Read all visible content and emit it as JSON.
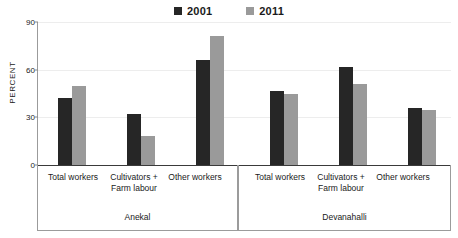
{
  "chart_data": {
    "type": "bar",
    "title": "",
    "xlabel": "",
    "ylabel": "PERCENT",
    "ylim": [
      0,
      90
    ],
    "yticks": [
      0,
      30,
      60,
      90
    ],
    "ytick_labels": [
      "0",
      "30",
      "60",
      "90"
    ],
    "grid": true,
    "legend_position": "top-center",
    "groups": [
      {
        "name": "Anekal",
        "categories": [
          "Total workers",
          "Cultivators +\nFarm labour",
          "Other workers"
        ]
      },
      {
        "name": "Devanahalli",
        "categories": [
          "Total workers",
          "Cultivators +\nFarm labour",
          "Other workers"
        ]
      }
    ],
    "categories": [
      "Total workers",
      "Cultivators + Farm labour",
      "Other workers",
      "Total workers",
      "Cultivators + Farm labour",
      "Other workers"
    ],
    "series": [
      {
        "name": "2001",
        "color": "#262626",
        "values": [
          42,
          32,
          66,
          46.5,
          62,
          36
        ]
      },
      {
        "name": "2011",
        "color": "#9a9a9a",
        "values": [
          49.5,
          18,
          81,
          44.5,
          51,
          34.5
        ]
      }
    ]
  },
  "legend": {
    "entries": [
      {
        "label": "2001",
        "color": "#262626",
        "swatch_name": "legend-swatch-2001"
      },
      {
        "label": "2011",
        "color": "#9a9a9a",
        "swatch_name": "legend-swatch-2011"
      }
    ]
  },
  "axis": {
    "y_title": "PERCENT",
    "y_ticks": [
      "90",
      "60",
      "30",
      "0"
    ]
  },
  "categories_display": [
    {
      "line1": "Total workers",
      "line2": ""
    },
    {
      "line1": "Cultivators +",
      "line2": "Farm labour"
    },
    {
      "line1": "Other workers",
      "line2": ""
    },
    {
      "line1": "Total workers",
      "line2": ""
    },
    {
      "line1": "Cultivators +",
      "line2": "Farm labour"
    },
    {
      "line1": "Other workers",
      "line2": ""
    }
  ],
  "group_labels": [
    {
      "name": "Anekal"
    },
    {
      "name": "Devanahalli"
    }
  ]
}
